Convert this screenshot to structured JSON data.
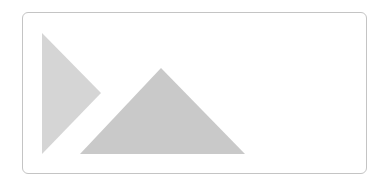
{
  "placeholder": {
    "icon": "image-placeholder-icon",
    "colors": {
      "border": "#c4c4c4",
      "background": "#ffffff",
      "left_triangle": "#d5d5d5",
      "mountain_triangle": "#c9c9c9"
    }
  }
}
